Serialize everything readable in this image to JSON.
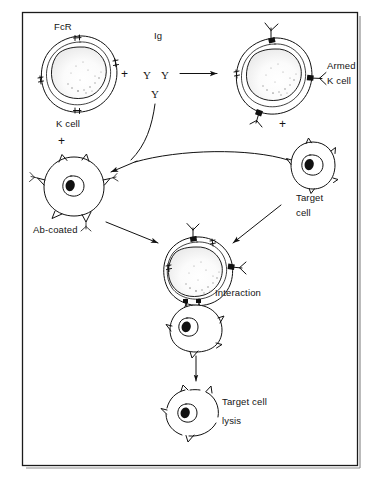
{
  "figure": {
    "background_color": "#ffffff",
    "ink_color": "#111111",
    "frame": {
      "x": 22,
      "y": 12,
      "width": 335,
      "height": 453
    }
  },
  "labels": {
    "fcr": "FcR",
    "k_cell": "K cell",
    "ig": "Ig",
    "armed": "Armed",
    "armed_k_cell": "K cell",
    "ab_coated": "Ab-coated",
    "target": "Target",
    "target_cell_line2": "cell",
    "interaction": "Interaction",
    "target_cell_lysis_line1": "Target cell",
    "target_cell_lysis_line2": "lysis"
  },
  "symbols": {
    "plus_ig": "+",
    "plus_k_cell": "+",
    "plus_armed": "+",
    "antibody_y1": "Y",
    "antibody_y2": "Y",
    "antibody_y3": "Y"
  },
  "cells": [
    {
      "name": "k-cell",
      "label": "K cell",
      "receptor_label": "FcR",
      "cx": 79,
      "cy": 74,
      "receptors": 4,
      "armed": false,
      "description": "Killer cell with Fc receptors, double-contour membrane, granular nucleus"
    },
    {
      "name": "armed-k-cell",
      "label": "Armed K cell",
      "cx": 273,
      "cy": 76,
      "receptors": 4,
      "armed": true,
      "description": "K cell with immunoglobulin bound to Fc receptors"
    },
    {
      "name": "ab-coated-cell",
      "label": "Ab-coated",
      "cx": 74,
      "cy": 186,
      "spikes": 6,
      "antibody_coated": true,
      "description": "Antigen-bearing target cell coated with antibody"
    },
    {
      "name": "target-cell",
      "label": "Target cell",
      "cx": 313,
      "cy": 166,
      "spikes": 5,
      "antibody_coated": false,
      "description": "Target cell bearing surface antigens"
    },
    {
      "name": "interaction-effector-cell",
      "label": "Interaction",
      "cx": 196,
      "cy": 272,
      "armed": true,
      "description": "Armed K cell conjugated to target cell"
    },
    {
      "name": "interaction-target-cell",
      "cx": 196,
      "cy": 323,
      "description": "Target cell bound to effector via antibody bridge"
    },
    {
      "name": "lysed-target-cell",
      "label": "Target cell lysis",
      "cx": 196,
      "cy": 409,
      "description": "Target cell with disrupted membrane after lysis"
    }
  ],
  "arrows": [
    {
      "name": "arming-arrow",
      "from": "ig",
      "to": "armed-k-cell",
      "type": "straight-horizontal"
    },
    {
      "name": "ig-to-ab-coated-arrow",
      "from": "ig",
      "to": "ab-coated-cell",
      "type": "curved"
    },
    {
      "name": "target-to-ab-coated-arrow",
      "from": "target-cell",
      "to": "ab-coated-cell",
      "type": "curved"
    },
    {
      "name": "ab-coated-to-interaction-arrow",
      "from": "ab-coated-cell",
      "to": "interaction",
      "type": "straight-diagonal"
    },
    {
      "name": "target-to-interaction-arrow",
      "from": "target-cell",
      "to": "interaction",
      "type": "straight-diagonal"
    },
    {
      "name": "interaction-to-lysis-arrow",
      "from": "interaction",
      "to": "lysed-target-cell",
      "type": "straight-vertical"
    }
  ]
}
